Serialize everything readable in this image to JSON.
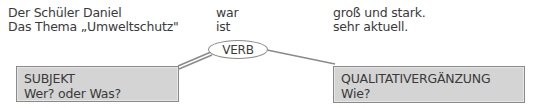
{
  "sentences": [
    {
      "subject": "Der Schüler Daniel",
      "verb": "war",
      "complement": "groß und stark."
    },
    {
      "subject": "Das Thema „Umweltschutz\"",
      "verb": "ist",
      "complement": "sehr aktuell."
    }
  ],
  "diagram": {
    "verb_label": "VERB",
    "subject_box": {
      "title": "SUBJEKT",
      "question": "Wer? oder Was?"
    },
    "complement_box": {
      "title": "QUALITATIVERGÄNZUNG",
      "question": "Wie?"
    },
    "colors": {
      "box_fill": "#d4d4d4",
      "border": "#8a8a8a",
      "text": "#3a3a3a"
    }
  }
}
